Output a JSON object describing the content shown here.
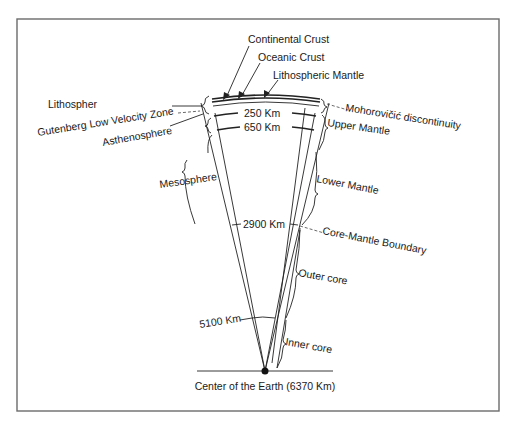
{
  "diagram": {
    "title": "",
    "top_labels": {
      "continental_crust": "Continental Crust",
      "oceanic_crust": "Oceanic Crust",
      "lithospheric_mantle": "Lithospheric Mantle"
    },
    "left_labels": {
      "lithosphere": "Lithospher",
      "gutenberg": "Gutenberg Low Velocity Zone",
      "asthenosphere": "Asthenosphere",
      "mesosphere": "Mesosphere",
      "depth_5100": "5100 Km"
    },
    "right_labels": {
      "moho": "Mohorovičić discontinuity",
      "upper_mantle": "Upper Mantle",
      "lower_mantle": "Lower Mantle",
      "core_mantle_boundary": "Core-Mantle Boundary",
      "outer_core": "Outer core",
      "inner_core": "Inner core"
    },
    "depths": {
      "d250": "250 Km",
      "d650": "650 Km",
      "d2900": "2900 Km"
    },
    "center_label": "Center of the Earth (6370 Km)",
    "colors": {
      "line": "#222222",
      "frame": "#6b6b6b",
      "background": "#ffffff"
    }
  }
}
